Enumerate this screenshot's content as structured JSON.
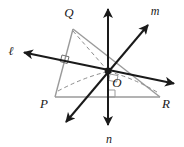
{
  "diagram": {
    "type": "3d-geometry-perpendicular-lines",
    "colors": {
      "triangle_stroke": "#9a9a9a",
      "line_stroke": "#1a1a1a",
      "dashed_stroke": "#8c8c8c",
      "label_fill": "#1a1a1a",
      "background": "#ffffff"
    },
    "points": [
      {
        "id": "Q",
        "label": "Q",
        "x": 73,
        "y": 29,
        "label_x": 69,
        "label_y": 17
      },
      {
        "id": "P",
        "label": "P",
        "x": 55,
        "y": 97,
        "label_x": 44,
        "label_y": 108
      },
      {
        "id": "R",
        "label": "R",
        "x": 160,
        "y": 97,
        "label_x": 164,
        "label_y": 108
      },
      {
        "id": "O",
        "label": "O",
        "x": 108,
        "y": 71,
        "label_x": 114,
        "label_y": 87
      }
    ],
    "lines": [
      {
        "id": "l",
        "label": "ℓ",
        "label_x": 10,
        "label_y": 54,
        "x1": 22,
        "y1": 52,
        "x2": 176,
        "y2": 84,
        "arrows": "both"
      },
      {
        "id": "m",
        "label": "m",
        "label_x": 152,
        "label_y": 14,
        "x1": 150,
        "y1": 23,
        "x2": 64,
        "y2": 124,
        "arrows": "both"
      },
      {
        "id": "n",
        "label": "n",
        "label_x": 105,
        "label_y": 142,
        "x1": 108,
        "y1": 7,
        "x2": 108,
        "y2": 127,
        "arrows": "both"
      }
    ],
    "triangle_edges": [
      {
        "from": "P",
        "to": "Q"
      },
      {
        "from": "Q",
        "to": "R"
      },
      {
        "from": "P",
        "to": "R"
      }
    ],
    "dashed_segments": [
      {
        "from": "Q",
        "to": "O",
        "style": "dashed"
      },
      {
        "from": "P",
        "to": "O",
        "style": "dashed-curve"
      },
      {
        "from": "R",
        "to": "O",
        "style": "dashed-curve"
      }
    ],
    "right_angle_marks": [
      {
        "at": "PQ-near-O",
        "x": 66,
        "y": 57
      },
      {
        "at": "O-vertical-base",
        "x": 108,
        "y": 96
      },
      {
        "at": "O-corner",
        "x": 113,
        "y": 72
      }
    ]
  }
}
